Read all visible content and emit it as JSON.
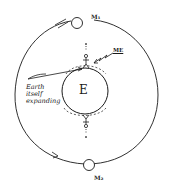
{
  "diagram": {
    "labels": {
      "moon_top": "M₁",
      "moon_bottom": "M₂",
      "earth": "E",
      "me": "ME",
      "note_line1": "Earth",
      "note_line2": "itself",
      "note_line3": "expanding"
    },
    "colors": {
      "ink": "#1a1a1a",
      "paper": "#ffffff"
    }
  }
}
